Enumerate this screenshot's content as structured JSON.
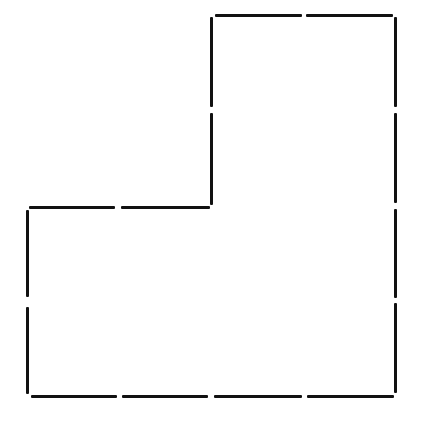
{
  "figure": {
    "stroke_color": "#111111",
    "stroke_width": 3,
    "segment_count": 16,
    "segments": [
      {
        "id": "top-1",
        "orient": "h",
        "x1": 215,
        "x2": 302,
        "y": 15
      },
      {
        "id": "top-2",
        "orient": "h",
        "x1": 306,
        "x2": 393,
        "y": 15
      },
      {
        "id": "inner-vertical-1",
        "orient": "v",
        "x": 211,
        "y1": 17,
        "y2": 107
      },
      {
        "id": "inner-vertical-2",
        "orient": "v",
        "x": 211,
        "y1": 113,
        "y2": 205
      },
      {
        "id": "right-1",
        "orient": "v",
        "x": 395,
        "y1": 17,
        "y2": 107
      },
      {
        "id": "right-2",
        "orient": "v",
        "x": 395,
        "y1": 113,
        "y2": 203
      },
      {
        "id": "right-3",
        "orient": "v",
        "x": 395,
        "y1": 209,
        "y2": 298
      },
      {
        "id": "right-4",
        "orient": "v",
        "x": 395,
        "y1": 303,
        "y2": 393
      },
      {
        "id": "middle-1",
        "orient": "h",
        "x1": 29,
        "x2": 115,
        "y": 207
      },
      {
        "id": "middle-2",
        "orient": "h",
        "x1": 121,
        "x2": 210,
        "y": 207
      },
      {
        "id": "left-1",
        "orient": "v",
        "x": 27,
        "y1": 210,
        "y2": 297
      },
      {
        "id": "left-2",
        "orient": "v",
        "x": 27,
        "y1": 307,
        "y2": 394
      },
      {
        "id": "bottom-1",
        "orient": "h",
        "x1": 31,
        "x2": 117,
        "y": 396
      },
      {
        "id": "bottom-2",
        "orient": "h",
        "x1": 122,
        "x2": 208,
        "y": 396
      },
      {
        "id": "bottom-3",
        "orient": "h",
        "x1": 214,
        "x2": 302,
        "y": 396
      },
      {
        "id": "bottom-4",
        "orient": "h",
        "x1": 307,
        "x2": 394,
        "y": 396
      }
    ]
  }
}
